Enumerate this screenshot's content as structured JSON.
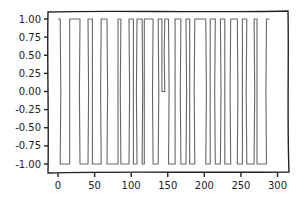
{
  "chart_data": {
    "type": "line",
    "style": "xkcd",
    "title": "",
    "xlabel": "",
    "ylabel": "",
    "xlim": [
      -8,
      312
    ],
    "ylim": [
      -1.1,
      1.1
    ],
    "grid": false,
    "legend": null,
    "xticks": [
      0,
      50,
      100,
      150,
      200,
      250,
      300
    ],
    "xtick_labels": [
      "0",
      "50",
      "100",
      "150",
      "200",
      "250",
      "300"
    ],
    "yticks": [
      1.0,
      0.75,
      0.5,
      0.25,
      0.0,
      -0.25,
      -0.5,
      -0.75,
      -1.0
    ],
    "ytick_labels": [
      "1.00",
      "0.75",
      "0.50",
      "0.25",
      "0.00",
      "-0.25",
      "-0.50",
      "-0.75",
      "-1.00"
    ],
    "line_color": "#666666",
    "series": [
      {
        "name": "square wave",
        "description": "Step signal switching between -1 and 1 at irregular intervals",
        "x": [
          0,
          3,
          3,
          16,
          16,
          30,
          30,
          41,
          41,
          47,
          47,
          59,
          59,
          67,
          67,
          82,
          82,
          86,
          86,
          97,
          97,
          103,
          103,
          108,
          108,
          115,
          115,
          118,
          118,
          130,
          130,
          137,
          137,
          142,
          142,
          146,
          146,
          151,
          151,
          160,
          160,
          168,
          168,
          175,
          175,
          180,
          180,
          187,
          187,
          202,
          202,
          208,
          208,
          215,
          215,
          222,
          222,
          228,
          228,
          236,
          236,
          245,
          245,
          252,
          252,
          258,
          258,
          268,
          268,
          272,
          272,
          285,
          285,
          289
        ],
        "y": [
          1,
          1,
          -1,
          -1,
          1,
          1,
          -1,
          -1,
          1,
          1,
          -1,
          -1,
          1,
          1,
          -1,
          -1,
          1,
          1,
          -1,
          -1,
          1,
          1,
          -1,
          -1,
          1,
          1,
          -1,
          -1,
          1,
          1,
          -1,
          -1,
          1,
          1,
          0,
          0,
          1,
          1,
          -1,
          -1,
          1,
          1,
          -1,
          -1,
          1,
          1,
          -1,
          -1,
          1,
          1,
          -1,
          -1,
          1,
          1,
          -1,
          -1,
          1,
          1,
          -1,
          -1,
          1,
          1,
          -1,
          -1,
          1,
          1,
          -1,
          -1,
          1,
          1,
          -1,
          -1,
          1,
          1
        ]
      }
    ]
  }
}
